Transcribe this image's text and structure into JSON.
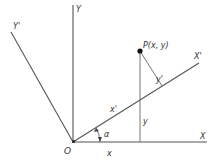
{
  "diagram": {
    "type": "coordinate-rotation",
    "labels": {
      "y_axis": "Y",
      "y_prime_axis": "Y'",
      "x_axis": "X",
      "x_prime_axis": "X'",
      "point": "P(x, y)",
      "origin": "O",
      "angle": "α",
      "x_coord": "x",
      "y_coord": "y",
      "x_prime_coord": "x'",
      "y_prime_coord": "y'"
    },
    "colors": {
      "line": "#555555",
      "text": "#333333",
      "point": "#111111"
    }
  }
}
